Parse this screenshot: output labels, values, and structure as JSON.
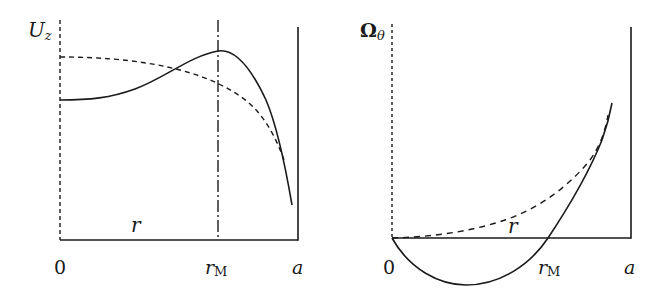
{
  "figure": {
    "panels": [
      {
        "id": "left",
        "y_label_main": "U",
        "y_label_sub": "z",
        "x_var_label": "r",
        "origin_label": "0",
        "marker_label_main": "r",
        "marker_label_sub": "M",
        "wall_label": "a",
        "curves": [
          {
            "name": "solid-profile",
            "style": "solid",
            "description": "rises from nonzero value at axis to maximum at r_M then falls steeply toward wall"
          },
          {
            "name": "dashed-profile",
            "style": "dashed",
            "description": "maximum at axis, decreasing monotonically toward wall"
          }
        ],
        "marker_line": {
          "style": "dash-dot",
          "at": "r_M"
        }
      },
      {
        "id": "right",
        "y_label_main": "Ω",
        "y_label_sub": "θ",
        "x_var_label": "r",
        "origin_label": "0",
        "marker_label_main": "r",
        "marker_label_sub": "M",
        "wall_label": "a",
        "curves": [
          {
            "name": "solid-profile",
            "style": "solid",
            "description": "zero at axis, negative minimum, crosses zero at r_M, rises steeply"
          },
          {
            "name": "dashed-profile",
            "style": "dashed",
            "description": "zero at axis, monotonically increasing"
          }
        ]
      }
    ],
    "colors": {
      "ink": "#1a1a1a",
      "background": "#ffffff"
    }
  }
}
